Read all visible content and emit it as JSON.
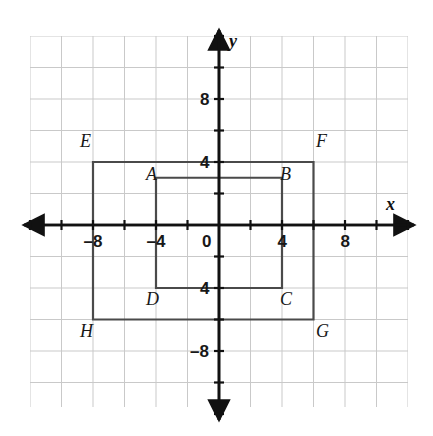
{
  "figure": {
    "kind": "coordinate-plane-diagram",
    "background_color": "#ffffff",
    "grid_color": "#c9c9c9",
    "axis_color": "#111111",
    "shape_color": "#4a4a4a",
    "label_color": "#181818"
  },
  "grid": {
    "cols": 12,
    "rows": 12,
    "cell_px": 31.5,
    "units_per_cell": 2,
    "left_px": 30,
    "top_px": 36
  },
  "axes": {
    "x_label": "x",
    "y_label": "y",
    "origin_label": "0",
    "x_min": -12,
    "x_max": 12,
    "y_min": -12,
    "y_max": 12,
    "tick_step": 2,
    "arrows": "both-ends",
    "x_tick_labels": [
      {
        "value": -8,
        "text": "–8"
      },
      {
        "value": -4,
        "text": "–4"
      },
      {
        "value": 4,
        "text": "4"
      },
      {
        "value": 8,
        "text": "8"
      }
    ],
    "y_tick_labels": [
      {
        "value": 8,
        "text": "8"
      },
      {
        "value": 4,
        "text": "4"
      },
      {
        "value": -4,
        "text": "4"
      },
      {
        "value": -8,
        "text": "–8"
      }
    ]
  },
  "chart_data": {
    "type": "scatter",
    "title": "",
    "xlabel": "x",
    "ylabel": "y",
    "xlim": [
      -12,
      12
    ],
    "ylim": [
      -12,
      12
    ],
    "grid": true,
    "legend": "none",
    "shapes": [
      {
        "name": "rectangle-ABCD",
        "closed": true,
        "vertices": [
          {
            "label": "A",
            "x": -4,
            "y": 3
          },
          {
            "label": "B",
            "x": 4,
            "y": 3
          },
          {
            "label": "C",
            "x": 4,
            "y": -4
          },
          {
            "label": "D",
            "x": -4,
            "y": -4
          }
        ]
      },
      {
        "name": "rectangle-EFGH",
        "closed": true,
        "vertices": [
          {
            "label": "E",
            "x": -8,
            "y": 4
          },
          {
            "label": "F",
            "x": 6,
            "y": 4
          },
          {
            "label": "G",
            "x": 6,
            "y": -6
          },
          {
            "label": "H",
            "x": -8,
            "y": -6
          }
        ]
      }
    ]
  },
  "vertex_labels": [
    {
      "text": "E",
      "x": 80,
      "y": 132
    },
    {
      "text": "F",
      "x": 316,
      "y": 132
    },
    {
      "text": "A",
      "x": 146,
      "y": 165
    },
    {
      "text": "B",
      "x": 280,
      "y": 165
    },
    {
      "text": "D",
      "x": 146,
      "y": 290
    },
    {
      "text": "C",
      "x": 280,
      "y": 290
    },
    {
      "text": "H",
      "x": 80,
      "y": 322
    },
    {
      "text": "G",
      "x": 316,
      "y": 322
    }
  ]
}
